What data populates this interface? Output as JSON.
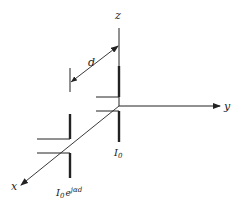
{
  "diagram": {
    "axes": {
      "x_label": "x",
      "y_label": "y",
      "z_label": "z"
    },
    "spacing_label": "d",
    "dipole_origin": {
      "current_label": "I",
      "current_sub": "0"
    },
    "dipole_offset": {
      "current_label": "I",
      "current_sub": "0",
      "current_exp": "e",
      "current_phase": "jαd"
    },
    "colors": {
      "line": "#222222",
      "background": "#ffffff"
    }
  }
}
